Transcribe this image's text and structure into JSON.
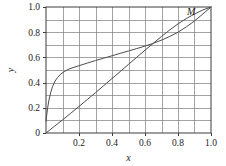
{
  "chart_data": {
    "type": "line",
    "title": "",
    "xlabel": "x",
    "ylabel": "y",
    "xlim": [
      0.0,
      1.0
    ],
    "ylim": [
      0.0,
      1.0
    ],
    "grid": true,
    "grid_x_step": 0.1,
    "grid_y_step": 0.1,
    "legend": "none",
    "xticks": [
      0.2,
      0.4,
      0.6,
      0.8,
      1.0
    ],
    "xticklabels": [
      "0.2",
      "0.4",
      "0.6",
      "0.8",
      "1.0"
    ],
    "yticks": [
      0.0,
      0.2,
      0.4,
      0.6,
      0.8,
      1.0
    ],
    "yticklabels": [
      "0",
      "0.2",
      "0.4",
      "0.6",
      "0.8",
      "1.0"
    ],
    "annotations": [
      {
        "text": "M",
        "x": 0.88,
        "y": 0.94
      }
    ],
    "series": [
      {
        "name": "concave-curve",
        "color": "#4d4d4d",
        "x": [
          0.0,
          0.005,
          0.01,
          0.018,
          0.028,
          0.04,
          0.055,
          0.07,
          0.09,
          0.11,
          0.14,
          0.17,
          0.2,
          0.25,
          0.3,
          0.35,
          0.4,
          0.45,
          0.5,
          0.55,
          0.6,
          0.65,
          0.7,
          0.75,
          0.8,
          0.85,
          0.88,
          0.9,
          0.95,
          1.0
        ],
        "y": [
          0.095,
          0.15,
          0.2,
          0.262,
          0.318,
          0.37,
          0.412,
          0.441,
          0.468,
          0.487,
          0.508,
          0.522,
          0.534,
          0.555,
          0.575,
          0.594,
          0.613,
          0.632,
          0.651,
          0.67,
          0.69,
          0.712,
          0.737,
          0.766,
          0.8,
          0.842,
          0.87,
          0.89,
          0.944,
          1.0
        ]
      },
      {
        "name": "convex-curve",
        "color": "#4d4d4d",
        "x": [
          0.0,
          0.05,
          0.1,
          0.15,
          0.2,
          0.25,
          0.3,
          0.35,
          0.4,
          0.45,
          0.5,
          0.55,
          0.6,
          0.65,
          0.7,
          0.75,
          0.8,
          0.85,
          0.88,
          0.9,
          0.95,
          1.0
        ],
        "y": [
          0.0,
          0.052,
          0.104,
          0.157,
          0.211,
          0.265,
          0.32,
          0.376,
          0.432,
          0.488,
          0.545,
          0.601,
          0.657,
          0.712,
          0.766,
          0.818,
          0.866,
          0.908,
          0.93,
          0.944,
          0.976,
          1.0
        ]
      }
    ]
  },
  "figure": {
    "background_color": "#ffffff",
    "grid_color": "#8c8c8c",
    "frame_color": "#3c3c3c",
    "curve_color": "#4d4d4d"
  }
}
